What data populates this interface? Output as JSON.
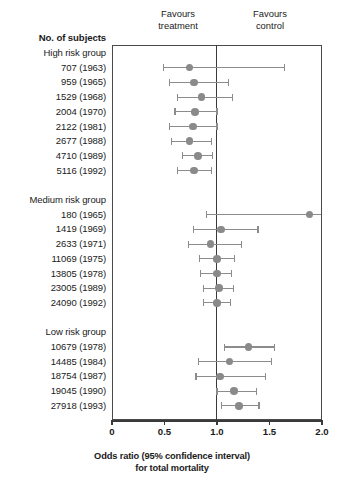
{
  "header": {
    "left_label": "Favours\ntreatment",
    "right_label": "Favours\ncontrol",
    "column_title": "No. of subjects"
  },
  "axis": {
    "xlabel": "Odds ratio (95% confidence interval)\nfor total mortality",
    "ticks": [
      "0",
      "0.5",
      "1.0",
      "1.5",
      "2.0"
    ],
    "tick_values": [
      0,
      0.5,
      1.0,
      1.5,
      2.0
    ]
  },
  "chart_data": {
    "type": "forest",
    "title": "",
    "xlabel": "Odds ratio (95% confidence interval) for total mortality",
    "ylabel": "No. of subjects",
    "xlim": [
      0,
      2.0
    ],
    "xticks": [
      0,
      0.5,
      1.0,
      1.5,
      2.0
    ],
    "xticklabels": [
      "0",
      "0.5",
      "1.0",
      "1.5",
      "2.0"
    ],
    "null_line": 1.0,
    "grid": false,
    "legend": "none",
    "annotations": [
      "Favours treatment",
      "Favours control"
    ],
    "groups": [
      {
        "name": "High risk group",
        "rows": [
          {
            "label": "707 (1963)",
            "n": 707,
            "year": 1963,
            "or": 0.74,
            "ci_low": 0.49,
            "ci_high": 1.64
          },
          {
            "label": "959 (1965)",
            "n": 959,
            "year": 1965,
            "or": 0.78,
            "ci_low": 0.55,
            "ci_high": 1.11
          },
          {
            "label": "1529 (1968)",
            "n": 1529,
            "year": 1968,
            "or": 0.85,
            "ci_low": 0.62,
            "ci_high": 1.15
          },
          {
            "label": "2004 (1970)",
            "n": 2004,
            "year": 1970,
            "or": 0.79,
            "ci_low": 0.6,
            "ci_high": 1.0
          },
          {
            "label": "2122 (1981)",
            "n": 2122,
            "year": 1981,
            "or": 0.77,
            "ci_low": 0.55,
            "ci_high": 1.0
          },
          {
            "label": "2677 (1988)",
            "n": 2677,
            "year": 1988,
            "or": 0.74,
            "ci_low": 0.57,
            "ci_high": 0.95
          },
          {
            "label": "4710 (1989)",
            "n": 4710,
            "year": 1989,
            "or": 0.82,
            "ci_low": 0.67,
            "ci_high": 0.96
          },
          {
            "label": "5116 (1992)",
            "n": 5116,
            "year": 1992,
            "or": 0.78,
            "ci_low": 0.62,
            "ci_high": 0.95
          }
        ]
      },
      {
        "name": "Medium risk group",
        "rows": [
          {
            "label": "180 (1965)",
            "n": 180,
            "year": 1965,
            "or": 1.88,
            "ci_low": 0.9,
            "ci_high": 2.0
          },
          {
            "label": "1419 (1969)",
            "n": 1419,
            "year": 1969,
            "or": 1.04,
            "ci_low": 0.78,
            "ci_high": 1.39
          },
          {
            "label": "2633 (1971)",
            "n": 2633,
            "year": 1971,
            "or": 0.94,
            "ci_low": 0.73,
            "ci_high": 1.23
          },
          {
            "label": "11069 (1975)",
            "n": 11069,
            "year": 1975,
            "or": 1.0,
            "ci_low": 0.83,
            "ci_high": 1.17
          },
          {
            "label": "13805 (1978)",
            "n": 13805,
            "year": 1978,
            "or": 1.0,
            "ci_low": 0.84,
            "ci_high": 1.14
          },
          {
            "label": "23005 (1989)",
            "n": 23005,
            "year": 1989,
            "or": 1.02,
            "ci_low": 0.87,
            "ci_high": 1.16
          },
          {
            "label": "24090 (1992)",
            "n": 24090,
            "year": 1992,
            "or": 1.0,
            "ci_low": 0.87,
            "ci_high": 1.13
          }
        ]
      },
      {
        "name": "Low risk group",
        "rows": [
          {
            "label": "10679 (1978)",
            "n": 10679,
            "year": 1978,
            "or": 1.3,
            "ci_low": 1.07,
            "ci_high": 1.55
          },
          {
            "label": "14485 (1984)",
            "n": 14485,
            "year": 1984,
            "or": 1.12,
            "ci_low": 0.82,
            "ci_high": 1.52
          },
          {
            "label": "18754 (1987)",
            "n": 18754,
            "year": 1987,
            "or": 1.03,
            "ci_low": 0.8,
            "ci_high": 1.46
          },
          {
            "label": "19045 (1990)",
            "n": 19045,
            "year": 1990,
            "or": 1.16,
            "ci_low": 1.0,
            "ci_high": 1.38
          },
          {
            "label": "27918 (1993)",
            "n": 27918,
            "year": 1993,
            "or": 1.21,
            "ci_low": 1.04,
            "ci_high": 1.4
          }
        ]
      }
    ]
  },
  "colors": {
    "marker": "#8a8a8a",
    "ci_line": "#8c8c8c",
    "axis": "#3a3a3a",
    "text": "#1a1a1a",
    "background": "#ffffff"
  }
}
